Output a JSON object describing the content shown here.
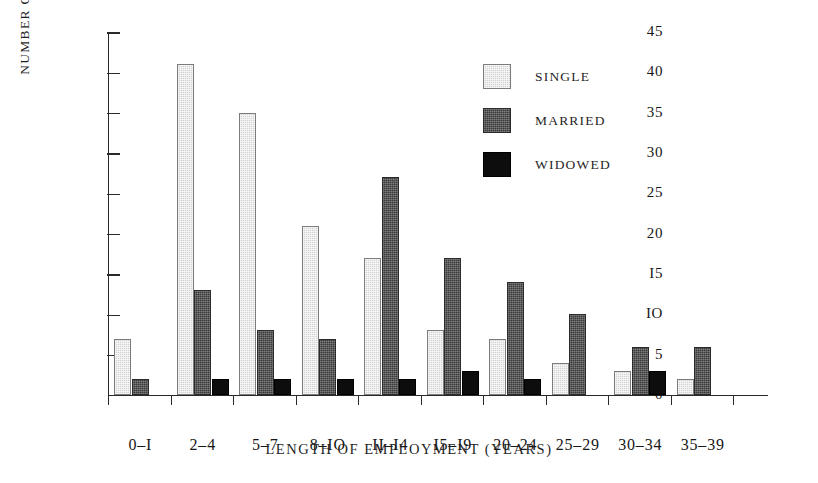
{
  "chart_data": {
    "type": "bar",
    "title": "",
    "xlabel": "LENGTH OF EMPLOYMENT (YEARS)",
    "ylabel": "NUMBER OF WORKERS",
    "categories": [
      "0–I",
      "2–4",
      "5–7",
      "8–IO",
      "II–I4",
      "I5–I9",
      "20–24",
      "25–29",
      "30–34",
      "35–39"
    ],
    "series": [
      {
        "name": "SINGLE",
        "color": "#d3d3d3",
        "values": [
          7,
          41,
          35,
          21,
          17,
          8,
          7,
          4,
          3,
          2
        ]
      },
      {
        "name": "MARRIED",
        "color": "#3a3a3a",
        "values": [
          2,
          13,
          8,
          7,
          27,
          17,
          14,
          10,
          6,
          6
        ]
      },
      {
        "name": "WIDOWED",
        "color": "#0d0d0d",
        "values": [
          0,
          2,
          2,
          2,
          2,
          3,
          2,
          0,
          3,
          0
        ]
      }
    ],
    "ylim": [
      0,
      45
    ],
    "yticks": [
      0,
      5,
      10,
      15,
      20,
      25,
      30,
      35,
      40,
      45
    ],
    "ytick_labels": [
      "0",
      "5",
      "IO",
      "I5",
      "20",
      "25",
      "30",
      "35",
      "40",
      "45"
    ],
    "grid": false,
    "legend_position": "upper-right"
  },
  "legend": {
    "entries": [
      {
        "label": "SINGLE"
      },
      {
        "label": "MARRIED"
      },
      {
        "label": "WIDOWED"
      }
    ]
  }
}
